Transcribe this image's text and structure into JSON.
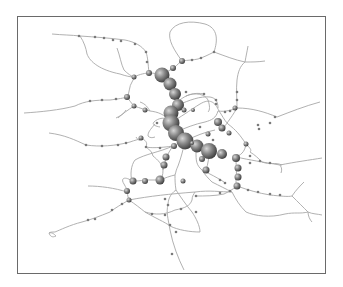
{
  "diagram": {
    "type": "network-graph",
    "colors": {
      "edge": "#a8a8a8",
      "node_dark": "#4a4a4a",
      "node_light": "#cfcfcf",
      "frame": "#6a6a6a"
    },
    "edges": [
      "M52,34 C62,35 72,35 80,36 C95,37 110,38 125,40 C135,42 142,46 146,52 C148,58 148,64 149,73",
      "M80,36 C84,42 86,48 87,54 C90,62 100,70 120,74 C126,76 130,77 134,77",
      "M117,48 C120,56 121,64 124,70 C128,74 131,76 134,77",
      "M134,77 C140,74 146,73 149,73 C155,73 158,74 162,75",
      "M162,75 C166,72 170,70 174,68 C178,64 180,62 182,61",
      "M182,61 C188,60 194,60 198,59 C204,57 208,55 214,52",
      "M182,61 C174,50 168,40 170,32 C175,22 190,20 205,24 C218,28 218,40 214,52",
      "M214,52 C225,56 235,60 245,62 C252,62 258,62 265,61",
      "M245,62 C246,56 247,52 248,46",
      "M245,62 C240,66 238,72 237,80 C236,90 237,98 237,108",
      "M24,113 C40,112 60,110 75,106 C85,101 95,100 110,100 C118,99 124,98 127,97",
      "M127,97 C130,92 129,86 132,82 C134,78 136,76 134,77",
      "M127,97 C132,104 134,106 134,106 C140,108 146,110 150,111 C158,112 164,114 171,122",
      "M134,106 C128,110 122,114 118,118",
      "M126,110 C124,114 120,116 116,118",
      "M49,133 C65,135 75,140 86,145 C100,147 115,146 130,142 C135,140 138,140 141,138",
      "M141,138 C145,140 148,142 146,147 C150,148 160,148 173,146",
      "M136,137 C138,140 140,142 141,138",
      "M171,122 C166,116 158,118 154,122 C152,124 154,126 160,127",
      "M171,122 C180,118 190,110 200,104 C210,98 215,102 219,111",
      "M178,105 C190,100 200,96 210,97 C216,98 218,102 218,108",
      "M180,100 C186,95 194,92 204,94",
      "M218,111 C225,112 232,110 237,108",
      "M237,108 C252,108 265,112 277,117 C290,112 305,106 320,102",
      "M219,111 C222,115 224,120 228,124 C236,130 240,135 246,144",
      "M237,108 C230,120 225,125 224,128",
      "M246,144 C250,148 252,150 250,152 C255,155 258,158 262,162 C270,165 275,162 282,165",
      "M246,144 C245,150 243,154 236,157",
      "M176,132 C185,128 195,124 205,122 C212,120 216,118 218,111",
      "M185,141 C195,136 205,132 215,130",
      "M171,122 C170,126 170,128 172,132",
      "M236,157 C250,160 262,162 280,165 C295,162 310,160 322,158",
      "M280,165 C282,168 282,170 281,173",
      "M236,160 C236,166 237,172 236,180 C236,182 236,184 237,186",
      "M237,186 C248,190 258,193 270,195 C280,196 288,197 292,196",
      "M292,196 C296,190 300,186 304,182",
      "M292,196 C298,202 304,208 308,212 C312,214 318,214 322,215",
      "M308,212 C308,216 310,220 312,222",
      "M237,186 C232,190 228,192 224,194 C215,196 205,196 195,196",
      "M196,152 C196,160 196,165 202,170 C205,175 208,178 212,182 C220,186 226,189 232,192",
      "M232,192 C236,200 240,206 246,212 C255,216 270,218 285,214 C295,212 300,214 308,212",
      "M202,170 C210,174 218,178 224,182",
      "M209,151 C209,158 208,164 206,170",
      "M185,141 C183,150 181,158 178,166 C176,170 176,172 175,175 C175,180 175,184 176,190",
      "M176,190 C180,196 186,205 192,212 C196,218 200,226 200,232",
      "M160,180 C165,178 170,176 175,175",
      "M173,146 C170,150 168,154 166,158 C165,162 164,166 163,170 C163,175 162,178 160,180",
      "M160,180 C155,180 150,180 145,180 C140,181 136,181 132,181",
      "M132,181 C130,175 131,165 135,160 C145,154 160,152 173,146",
      "M132,181 C125,176 120,178 124,184 C126,188 128,190 127,192",
      "M127,192 C115,188 100,186 88,186",
      "M127,192 C128,196 128,198 129,200 C135,204 140,208 145,212 C155,215 165,215 175,210 C185,208 190,206 192,200 C192,196 194,194 195,192",
      "M129,200 C122,204 115,208 110,212 C100,216 90,220 82,222 C70,225 60,230 55,232 C52,232 50,232 49,233",
      "M49,233 C50,236 52,238 56,236 C54,234 52,232 49,233",
      "M129,200 C150,196 170,194 195,192 C210,190 220,192 232,192",
      "M176,190 C170,194 168,200 168,205 C166,212 168,218 170,230 C173,245 178,258 184,270",
      "M145,212 C155,218 165,222 170,226 C178,230 190,232 200,232",
      "M146,147 C150,150 152,152 153,156 C158,160 162,164 163,170",
      "M150,111 C148,108 146,104 140,102",
      "M155,124 C150,130 148,132 148,136 C150,138 152,138 155,137",
      "M186,96 C195,92 205,94 208,100 C210,106 210,110 208,112"
    ],
    "nodes": [
      {
        "x": 162,
        "y": 75,
        "r": 7.5
      },
      {
        "x": 170,
        "y": 84,
        "r": 6.5
      },
      {
        "x": 175,
        "y": 94,
        "r": 6
      },
      {
        "x": 178,
        "y": 105,
        "r": 6
      },
      {
        "x": 171,
        "y": 113,
        "r": 7.5
      },
      {
        "x": 171,
        "y": 123,
        "r": 8.5
      },
      {
        "x": 176,
        "y": 133,
        "r": 8
      },
      {
        "x": 185,
        "y": 141,
        "r": 8.5
      },
      {
        "x": 197,
        "y": 146,
        "r": 6.5
      },
      {
        "x": 209,
        "y": 151,
        "r": 8
      },
      {
        "x": 222,
        "y": 154,
        "r": 5
      },
      {
        "x": 236,
        "y": 158,
        "r": 4
      },
      {
        "x": 238,
        "y": 168,
        "r": 3.5
      },
      {
        "x": 238,
        "y": 177,
        "r": 3.5
      },
      {
        "x": 237,
        "y": 186,
        "r": 3.5
      },
      {
        "x": 218,
        "y": 122,
        "r": 4
      },
      {
        "x": 222,
        "y": 128,
        "r": 3.5
      },
      {
        "x": 206,
        "y": 170,
        "r": 3.5
      },
      {
        "x": 202,
        "y": 159,
        "r": 3
      },
      {
        "x": 174,
        "y": 146,
        "r": 3
      },
      {
        "x": 166,
        "y": 157,
        "r": 3.5
      },
      {
        "x": 164,
        "y": 165,
        "r": 3.5
      },
      {
        "x": 160,
        "y": 180,
        "r": 4.5
      },
      {
        "x": 145,
        "y": 181,
        "r": 3
      },
      {
        "x": 133,
        "y": 181,
        "r": 3.5
      },
      {
        "x": 127,
        "y": 191,
        "r": 3
      },
      {
        "x": 129,
        "y": 200,
        "r": 2.5
      },
      {
        "x": 134,
        "y": 77,
        "r": 2.5
      },
      {
        "x": 149,
        "y": 73,
        "r": 3
      },
      {
        "x": 127,
        "y": 97,
        "r": 3
      },
      {
        "x": 134,
        "y": 106,
        "r": 2.5
      },
      {
        "x": 145,
        "y": 110,
        "r": 2.5
      },
      {
        "x": 182,
        "y": 61,
        "r": 3
      },
      {
        "x": 173,
        "y": 68,
        "r": 3
      },
      {
        "x": 235,
        "y": 108,
        "r": 2.5
      },
      {
        "x": 246,
        "y": 144,
        "r": 2.5
      },
      {
        "x": 229,
        "y": 133,
        "r": 2.5
      },
      {
        "x": 141,
        "y": 138,
        "r": 2.5
      },
      {
        "x": 184,
        "y": 110,
        "r": 2.5
      },
      {
        "x": 193,
        "y": 110,
        "r": 2
      },
      {
        "x": 208,
        "y": 134,
        "r": 2.5
      },
      {
        "x": 183,
        "y": 181,
        "r": 2.5
      },
      {
        "x": 192,
        "y": 143,
        "r": 2
      }
    ],
    "small_nodes": [
      [
        79,
        36
      ],
      [
        95,
        37
      ],
      [
        104,
        38
      ],
      [
        113,
        40
      ],
      [
        121,
        41
      ],
      [
        135,
        44
      ],
      [
        146,
        52
      ],
      [
        147,
        62
      ],
      [
        90,
        101
      ],
      [
        102,
        100
      ],
      [
        116,
        99
      ],
      [
        86,
        145
      ],
      [
        102,
        146
      ],
      [
        118,
        145
      ],
      [
        126,
        143
      ],
      [
        146,
        147
      ],
      [
        160,
        148
      ],
      [
        192,
        60
      ],
      [
        201,
        58
      ],
      [
        214,
        52
      ],
      [
        237,
        92
      ],
      [
        237,
        100
      ],
      [
        258,
        125
      ],
      [
        270,
        123
      ],
      [
        259,
        129
      ],
      [
        275,
        117
      ],
      [
        250,
        156
      ],
      [
        260,
        161
      ],
      [
        270,
        163
      ],
      [
        248,
        190
      ],
      [
        258,
        192
      ],
      [
        270,
        194
      ],
      [
        280,
        195
      ],
      [
        230,
        191
      ],
      [
        220,
        193
      ],
      [
        196,
        196
      ],
      [
        196,
        212
      ],
      [
        181,
        209
      ],
      [
        165,
        215
      ],
      [
        152,
        214
      ],
      [
        122,
        204
      ],
      [
        112,
        210
      ],
      [
        95,
        219
      ],
      [
        88,
        220
      ],
      [
        170,
        225
      ],
      [
        176,
        232
      ],
      [
        172,
        254
      ],
      [
        168,
        205
      ],
      [
        165,
        199
      ],
      [
        220,
        180
      ],
      [
        225,
        183
      ],
      [
        250,
        163
      ],
      [
        213,
        140
      ],
      [
        200,
        127
      ],
      [
        157,
        123
      ],
      [
        186,
        92
      ],
      [
        204,
        94
      ],
      [
        216,
        100
      ],
      [
        216,
        104
      ],
      [
        225,
        112
      ],
      [
        230,
        111
      ]
    ]
  }
}
